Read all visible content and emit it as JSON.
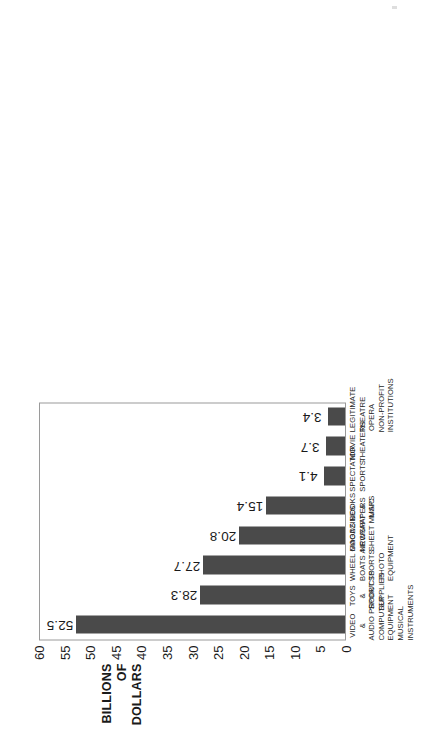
{
  "chart_data": {
    "type": "bar",
    "orientation": "vertical",
    "title": "",
    "xlabel": "",
    "ylabel": "BILLIONS OF DOLLARS",
    "ylabel_lines": [
      "BILLIONS",
      "OF",
      "DOLLARS"
    ],
    "ylim": [
      0,
      60
    ],
    "ytick_step": 5,
    "yticks": [
      60,
      55,
      50,
      45,
      40,
      35,
      30,
      25,
      20,
      15,
      10,
      5,
      0
    ],
    "ytick_labels": [
      "60",
      "55",
      "50",
      "45",
      "40",
      "35",
      "30",
      "25",
      "20",
      "15",
      "10",
      "5",
      "0"
    ],
    "grid": false,
    "legend": false,
    "bar_color": "#4a4a4a",
    "frame_color": "#9a9a9a",
    "background": "#ffffff",
    "categories": [
      "VIDEO & AUDIO PRODUCTS COMPUTER EQUIPMENT MUSICAL INSTRUMENTS",
      "TOYS & SPORT SUPPLIES",
      "WHEEL GOODS BOATS AIRCRAFT SPORTS PHOTO EQUIPMENT",
      "MAGAZINES NEWSPAPERS SHEET MUSIC",
      "BOOKS & MAPS",
      "SPECTATOR SPORTS",
      "MOVIE THEATERS",
      "LEGITIMATE THEATRE OPERA NON-PROFIT INSTITUTIONS"
    ],
    "category_lines": [
      [
        "VIDEO",
        "&",
        "AUDIO PRODUCTS",
        "COMPUTER",
        "EQUIPMENT",
        "MUSICAL",
        "INSTRUMENTS"
      ],
      [
        "TOYS",
        "&",
        "SPORT",
        "SUPPLIES"
      ],
      [
        "WHEEL GOODS",
        "BOATS AIRCRAFT",
        "SPORTS",
        "PHOTO",
        "EQUIPMENT"
      ],
      [
        "MAGAZINES",
        "NEWSPAPERS",
        "SHEET MUSIC"
      ],
      [
        "BOOKS",
        "&",
        "MAPS"
      ],
      [
        "SPECTATOR",
        "SPORTS"
      ],
      [
        "MOVIE",
        "THEATERS"
      ],
      [
        "LEGITIMATE",
        "THEATRE",
        "OPERA",
        "NON-PROFIT",
        "INSTITUTIONS"
      ]
    ],
    "values": [
      52.5,
      28.3,
      27.7,
      20.8,
      15.4,
      4.1,
      3.7,
      3.4
    ],
    "value_labels": [
      "52.5",
      "28.3",
      "27.7",
      "20.8",
      "15.4",
      "4.1",
      "3.7",
      "3.4"
    ]
  }
}
